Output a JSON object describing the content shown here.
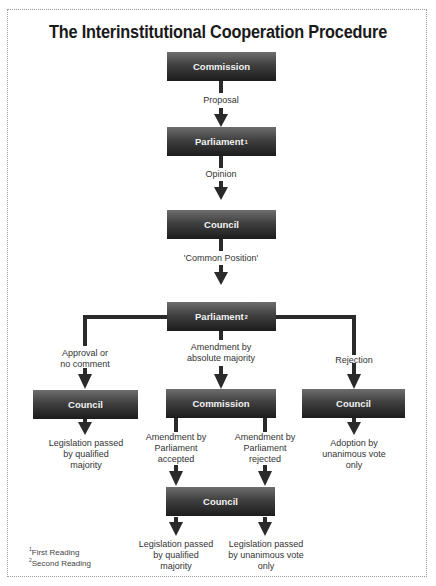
{
  "title": "The Interinstitutional Cooperation Procedure",
  "colors": {
    "box_top": "#6e6e6e",
    "box_bottom": "#1c1c1c",
    "box_text": "#f2f2f2",
    "line": "#2a2a2a",
    "label_text": "#333333",
    "frame": "#9a9a9a"
  },
  "nodes": {
    "commission_1": {
      "label": "Commission",
      "sup": ""
    },
    "parliament_1": {
      "label": "Parliament",
      "sup": "1"
    },
    "council_1": {
      "label": "Council",
      "sup": ""
    },
    "parliament_2": {
      "label": "Parliament",
      "sup": "2"
    },
    "council_left": {
      "label": "Council",
      "sup": ""
    },
    "commission_2": {
      "label": "Commission",
      "sup": ""
    },
    "council_right": {
      "label": "Council",
      "sup": ""
    },
    "council_bottom": {
      "label": "Council",
      "sup": ""
    }
  },
  "edge_labels": {
    "proposal": "Proposal",
    "opinion": "Opinion",
    "common_position": "'Common Position'",
    "approval": "Approval or\nno comment",
    "amendment_absolute": "Amendment by\nabsolute majority",
    "rejection": "Rejection",
    "amend_accepted": "Amendment by\nParliament\naccepted",
    "amend_rejected": "Amendment by\nParliament\nrejected"
  },
  "outcomes": {
    "left": "Legislation passed\nby qualified\nmajority",
    "right": "Adoption by\nunanimous vote\nonly",
    "bottom_left": "Legislation passed\nby qualified\nmajority",
    "bottom_right": "Legislation passed\nby unanimous vote\nonly"
  },
  "footnotes": {
    "n1_mark": "1",
    "n1_text": "First Reading",
    "n2_mark": "2",
    "n2_text": "Second Reading"
  }
}
